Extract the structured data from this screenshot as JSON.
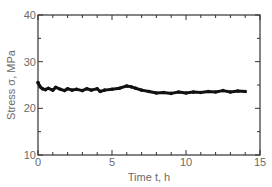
{
  "chart_data": {
    "type": "line",
    "title": "",
    "xlabel": "Time t, h",
    "ylabel": "Stress σ, MPa",
    "xlim": [
      0,
      15
    ],
    "ylim": [
      10,
      40
    ],
    "x_ticks": [
      0,
      5,
      10,
      15
    ],
    "y_ticks": [
      10,
      20,
      30,
      40
    ],
    "x_minor_step": 1,
    "y_minor_step": 5,
    "grid": false,
    "legend": null,
    "marker": "filled-circle",
    "series": [
      {
        "name": "Stress",
        "color": "#111111",
        "x": [
          0.0,
          0.15,
          0.3,
          0.5,
          0.7,
          1.0,
          1.2,
          1.5,
          1.8,
          2.0,
          2.3,
          2.6,
          3.0,
          3.3,
          3.6,
          4.0,
          4.2,
          4.5,
          5.0,
          5.5,
          6.0,
          6.3,
          6.6,
          7.0,
          7.5,
          8.0,
          8.5,
          9.0,
          9.5,
          10.0,
          10.5,
          11.0,
          11.5,
          12.0,
          12.5,
          13.0,
          13.5,
          14.0
        ],
        "y": [
          25.5,
          24.6,
          24.2,
          24.0,
          24.3,
          23.9,
          24.5,
          24.1,
          23.8,
          24.2,
          23.9,
          24.1,
          23.8,
          24.2,
          23.9,
          24.2,
          23.6,
          23.9,
          24.1,
          24.3,
          24.8,
          24.6,
          24.3,
          23.9,
          23.6,
          23.3,
          23.4,
          23.2,
          23.5,
          23.3,
          23.5,
          23.4,
          23.6,
          23.5,
          23.8,
          23.5,
          23.7,
          23.6
        ]
      }
    ]
  },
  "layout": {
    "plot_left_px": 38,
    "plot_right_px": 260,
    "plot_top_px": 15,
    "plot_bottom_px": 155
  }
}
